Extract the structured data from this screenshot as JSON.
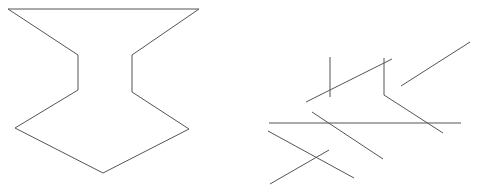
{
  "figure": {
    "stroke_color": "#555555",
    "background_color": "#ffffff",
    "shapes": [
      {
        "name": "goblet-outline",
        "kind": "polygon",
        "points": [
          [
            8,
            9
          ],
          [
            199,
            9
          ],
          [
            132,
            55
          ],
          [
            132,
            92
          ],
          [
            189,
            129
          ],
          [
            103,
            173
          ],
          [
            15,
            128
          ],
          [
            78,
            90
          ],
          [
            78,
            55
          ]
        ]
      }
    ],
    "segments": [
      {
        "name": "segment-vertical-short",
        "points": [
          [
            330,
            57
          ],
          [
            330,
            97
          ]
        ]
      },
      {
        "name": "segment-diagonal-upper",
        "points": [
          [
            306,
            102
          ],
          [
            392,
            59
          ]
        ]
      },
      {
        "name": "segment-bent",
        "points": [
          [
            384,
            58
          ],
          [
            384,
            95
          ],
          [
            443,
            133
          ]
        ]
      },
      {
        "name": "segment-diagonal-right",
        "points": [
          [
            401,
            86
          ],
          [
            470,
            42
          ]
        ]
      },
      {
        "name": "segment-horizontal",
        "points": [
          [
            269,
            123
          ],
          [
            461,
            123
          ]
        ]
      },
      {
        "name": "segment-diagonal-middle",
        "points": [
          [
            312,
            112
          ],
          [
            383,
            159
          ]
        ]
      },
      {
        "name": "segment-diagonal-lower",
        "points": [
          [
            268,
            131
          ],
          [
            354,
            178
          ]
        ]
      },
      {
        "name": "segment-diagonal-cross",
        "points": [
          [
            270,
            184
          ],
          [
            329,
            150
          ]
        ]
      }
    ]
  }
}
